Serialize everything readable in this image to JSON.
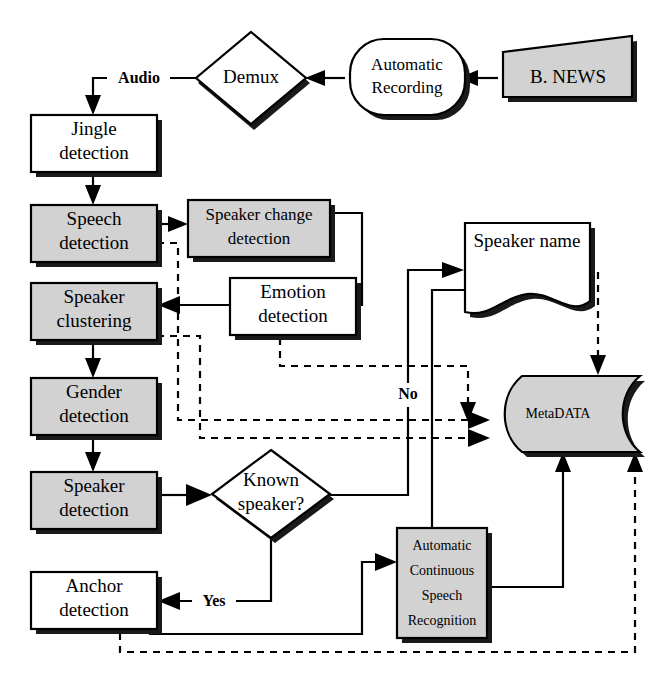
{
  "diagram": {
    "fill_gray": "#d2d2d2",
    "fill_white": "#ffffff",
    "line_color": "#000000",
    "nodes": [
      {
        "id": "bnews",
        "shape": "trapezoid",
        "fill": "gray",
        "label_lines": [
          "B. NEWS"
        ]
      },
      {
        "id": "auto_recording",
        "shape": "rounded",
        "fill": "white",
        "label_lines": [
          "Automatic",
          "Recording"
        ]
      },
      {
        "id": "demux",
        "shape": "diamond",
        "fill": "white",
        "label_lines": [
          "Demux"
        ]
      },
      {
        "id": "jingle",
        "shape": "rect",
        "fill": "white",
        "label_lines": [
          "Jingle",
          "detection"
        ]
      },
      {
        "id": "speech",
        "shape": "rect",
        "fill": "gray",
        "label_lines": [
          "Speech",
          "detection"
        ]
      },
      {
        "id": "speaker_change",
        "shape": "rect",
        "fill": "gray",
        "label_lines": [
          "Speaker change",
          "detection"
        ]
      },
      {
        "id": "speaker_cluster",
        "shape": "rect",
        "fill": "gray",
        "label_lines": [
          "Speaker",
          "clustering"
        ]
      },
      {
        "id": "emotion",
        "shape": "rect",
        "fill": "gray",
        "label_lines": [
          "Emotion",
          "detection"
        ]
      },
      {
        "id": "gender",
        "shape": "rect",
        "fill": "gray",
        "label_lines": [
          "Gender",
          "detection"
        ]
      },
      {
        "id": "speaker_det",
        "shape": "rect",
        "fill": "gray",
        "label_lines": [
          "Speaker",
          "detection"
        ]
      },
      {
        "id": "known_speaker",
        "shape": "diamond",
        "fill": "white",
        "label_lines": [
          "Known",
          "speaker?"
        ]
      },
      {
        "id": "speaker_name",
        "shape": "document",
        "fill": "white",
        "label_lines": [
          "Speaker name"
        ]
      },
      {
        "id": "metadata",
        "shape": "cylinder",
        "fill": "gray",
        "label_lines": [
          "MetaDATA"
        ]
      },
      {
        "id": "anchor",
        "shape": "rect",
        "fill": "white",
        "label_lines": [
          "Anchor",
          "detection"
        ]
      },
      {
        "id": "acsr",
        "shape": "rect",
        "fill": "gray",
        "label_lines": [
          "Automatic",
          "Continuous",
          "Speech",
          "Recognition"
        ]
      }
    ],
    "edge_labels": [
      {
        "id": "audio",
        "text": "Audio"
      },
      {
        "id": "no",
        "text": "No"
      },
      {
        "id": "yes",
        "text": "Yes"
      }
    ]
  }
}
